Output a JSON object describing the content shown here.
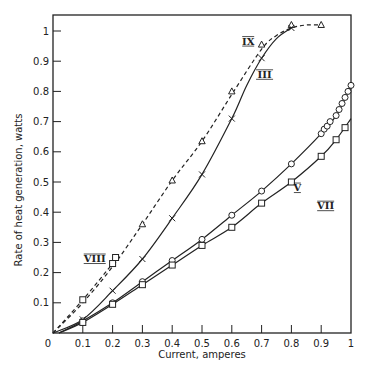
{
  "chart_data": {
    "type": "line",
    "title": "",
    "xlabel": "Current, amperes",
    "ylabel": "Rate of heat generation, watts",
    "xlim": [
      0,
      1
    ],
    "ylim": [
      0,
      1.05
    ],
    "grid": false,
    "x_ticks": [
      "0",
      "0.1",
      "0.2",
      "0.3",
      "0.4",
      "0.5",
      "0.6",
      "0.7",
      "0.8",
      "0.9",
      "1"
    ],
    "y_ticks": [
      "0.1",
      "0.2",
      "0.3",
      "0.4",
      "0.5",
      "0.6",
      "0.7",
      "0.8",
      "0.9",
      "1"
    ],
    "series": [
      {
        "name": "IX",
        "marker": "triangle",
        "line": "dashed",
        "x": [
          0.3,
          0.4,
          0.5,
          0.6,
          0.7,
          0.8,
          0.9
        ],
        "y": [
          0.36,
          0.505,
          0.635,
          0.8,
          0.955,
          1.02,
          1.02
        ],
        "curve": [
          [
            0,
            0
          ],
          [
            0.1,
            0.1
          ],
          [
            0.2,
            0.22
          ],
          [
            0.3,
            0.36
          ],
          [
            0.4,
            0.505
          ],
          [
            0.5,
            0.635
          ],
          [
            0.6,
            0.79
          ],
          [
            0.7,
            0.94
          ],
          [
            0.75,
            0.985
          ],
          [
            0.8,
            1.01
          ],
          [
            0.85,
            1.02
          ],
          [
            0.9,
            1.02
          ]
        ]
      },
      {
        "name": "III",
        "marker": "x",
        "line": "solid",
        "x": [
          0.1,
          0.2,
          0.3,
          0.4,
          0.5,
          0.6,
          0.7,
          0.8
        ],
        "y": [
          0.045,
          0.14,
          0.245,
          0.38,
          0.525,
          0.71,
          0.91,
          1.01
        ],
        "curve": [
          [
            0,
            0
          ],
          [
            0.1,
            0.045
          ],
          [
            0.2,
            0.14
          ],
          [
            0.3,
            0.245
          ],
          [
            0.4,
            0.38
          ],
          [
            0.5,
            0.525
          ],
          [
            0.6,
            0.71
          ],
          [
            0.65,
            0.82
          ],
          [
            0.7,
            0.91
          ],
          [
            0.75,
            0.975
          ],
          [
            0.8,
            1.01
          ]
        ]
      },
      {
        "name": "VIII",
        "marker": "square",
        "line": "dashed",
        "x": [
          0.1,
          0.2,
          0.21
        ],
        "y": [
          0.11,
          0.23,
          0.25
        ],
        "curve": [
          [
            0,
            0
          ],
          [
            0.1,
            0.11
          ],
          [
            0.2,
            0.23
          ],
          [
            0.22,
            0.26
          ]
        ]
      },
      {
        "name": "V",
        "marker": "circle",
        "line": "solid",
        "x": [
          0.1,
          0.2,
          0.3,
          0.4,
          0.5,
          0.6,
          0.7,
          0.8,
          0.9,
          0.91,
          0.92,
          0.93,
          0.95,
          0.96,
          0.97,
          0.98,
          0.99,
          1.0
        ],
        "y": [
          0.04,
          0.1,
          0.17,
          0.24,
          0.31,
          0.39,
          0.47,
          0.56,
          0.66,
          0.675,
          0.685,
          0.7,
          0.72,
          0.74,
          0.76,
          0.78,
          0.8,
          0.82
        ],
        "curve": [
          [
            0.02,
            0
          ],
          [
            0.1,
            0.04
          ],
          [
            0.2,
            0.1
          ],
          [
            0.3,
            0.17
          ],
          [
            0.4,
            0.24
          ],
          [
            0.5,
            0.31
          ],
          [
            0.6,
            0.39
          ],
          [
            0.7,
            0.47
          ],
          [
            0.8,
            0.56
          ],
          [
            0.9,
            0.66
          ],
          [
            0.95,
            0.72
          ],
          [
            1.0,
            0.82
          ]
        ]
      },
      {
        "name": "VII",
        "marker": "square",
        "line": "solid",
        "x": [
          0.1,
          0.2,
          0.3,
          0.4,
          0.5,
          0.6,
          0.7,
          0.8,
          0.9,
          0.95,
          0.98
        ],
        "y": [
          0.035,
          0.095,
          0.16,
          0.225,
          0.29,
          0.35,
          0.43,
          0.5,
          0.585,
          0.64,
          0.68
        ],
        "curve": [
          [
            0.02,
            0
          ],
          [
            0.1,
            0.035
          ],
          [
            0.2,
            0.095
          ],
          [
            0.3,
            0.16
          ],
          [
            0.4,
            0.225
          ],
          [
            0.5,
            0.29
          ],
          [
            0.6,
            0.35
          ],
          [
            0.7,
            0.43
          ],
          [
            0.8,
            0.5
          ],
          [
            0.9,
            0.585
          ],
          [
            0.95,
            0.64
          ],
          [
            1.0,
            0.71
          ]
        ]
      }
    ],
    "annotations": [
      {
        "text": "IX",
        "x": 0.655,
        "y": 0.955
      },
      {
        "text": "III",
        "x": 0.71,
        "y": 0.845
      },
      {
        "text": "VIII",
        "x": 0.14,
        "y": 0.235
      },
      {
        "text": "V",
        "x": 0.82,
        "y": 0.47
      },
      {
        "text": "VII",
        "x": 0.915,
        "y": 0.41
      }
    ]
  }
}
